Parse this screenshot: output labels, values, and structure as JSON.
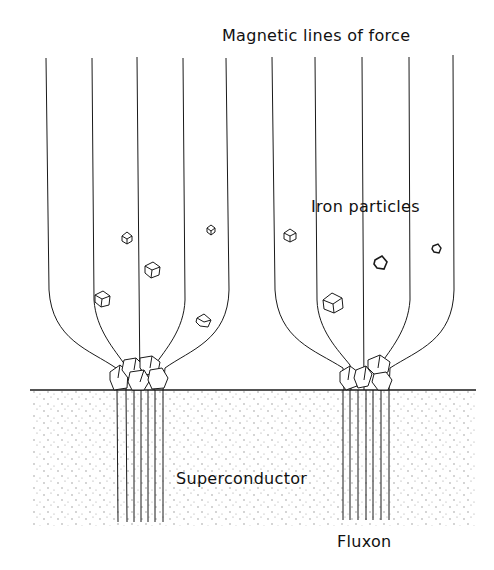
{
  "labels": {
    "magnetic_lines": "Magnetic lines of force",
    "iron_particles": "Iron particles",
    "superconductor": "Superconductor",
    "fluxon": "Fluxon"
  },
  "colors": {
    "line": "#1a1a1a",
    "background": "#ffffff",
    "stipple": "#8a8a8a"
  }
}
